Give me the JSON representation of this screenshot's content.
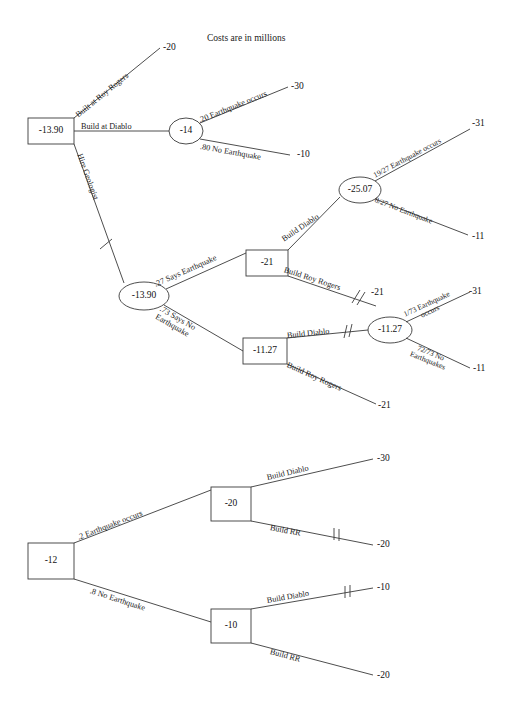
{
  "figure": {
    "title": "Costs are in millions",
    "kind": "decision-tree"
  },
  "tree_top": {
    "root": {
      "value": "-13.90",
      "shape": "square"
    },
    "nodes": {
      "diablo_chance": "-14",
      "geologist_chance": "-13.90",
      "says_eq_decision": "-21",
      "says_eq_diablo_chance": "-25.07",
      "says_no_eq_decision": "-11.27",
      "says_no_eq_diablo_chance": "-11.27"
    },
    "branches": {
      "built_roy_rogers": "Built at Roy Rogers",
      "build_at_diablo": "Build at Diablo",
      "hire_geologist": "Hire Geologist",
      "eq_occurs_20": ".20 Earthquake occurs",
      "no_eq_80": ".80 No Earthquake",
      "says_earthquake_27": ".27 Says Earthquake",
      "says_no_earthquake_73": ".73 Says No Earthquake",
      "build_diablo_a": "Build Diablo",
      "build_roy_rogers_a": "Build Roy Rogers",
      "eq_19_27": "19/27 Earthquake occurs",
      "no_eq_8_27": "8/27 No Earthquake",
      "build_diablo_b": "Build Diablo",
      "build_roy_rogers_b": "Build Roy Rogers",
      "eq_1_73": "1/73 Earthquake occurs",
      "no_eq_72_73": "72/73 No Earthquakes"
    },
    "payoffs": {
      "roy_rogers_top": "-20",
      "eq_occurs_30": "-30",
      "no_eq_10": "-10",
      "eq_19_27_val": "-31",
      "no_eq_8_27_val": "-11",
      "roy_rogers_a_val": "-21",
      "eq_1_73_val": "-31",
      "no_eq_72_73_val": "-11",
      "roy_rogers_b_val": "-21"
    }
  },
  "tree_bottom": {
    "root": {
      "value": "-12",
      "shape": "square"
    },
    "nodes": {
      "eq_decision": "-20",
      "no_eq_decision": "-10"
    },
    "branches": {
      "eq_occurs_2": ".2 Earthquake occurs",
      "no_eq_8": ".8 No Earthquake",
      "build_diablo_top": "Build Diablo",
      "build_rr_top": "Build RR",
      "build_diablo_bottom": "Build Diablo",
      "build_rr_bottom": "Build RR"
    },
    "payoffs": {
      "diablo_top": "-30",
      "rr_top": "-20",
      "diablo_bottom": "-10",
      "rr_bottom": "-20"
    }
  }
}
